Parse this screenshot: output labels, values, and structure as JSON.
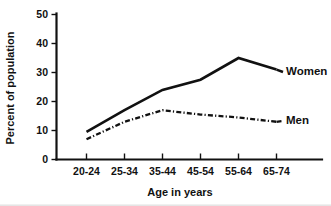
{
  "chart_data": {
    "type": "line",
    "title": "",
    "xlabel": "Age in years",
    "ylabel": "Percent of population",
    "categories": [
      "20-24",
      "25-34",
      "35-44",
      "45-54",
      "55-64",
      "65-74"
    ],
    "ylim": [
      0,
      50
    ],
    "yticks": [
      0,
      10,
      20,
      30,
      40,
      50
    ],
    "ytick_labels": [
      "0",
      "10",
      "20",
      "30",
      "40",
      "50"
    ],
    "grid": false,
    "legend_position": "line-end-labels",
    "series": [
      {
        "name": "Women",
        "style": "solid",
        "color": "#111111",
        "values": [
          9.5,
          17,
          24,
          27.5,
          35,
          31
        ]
      },
      {
        "name": "Men",
        "style": "dash-dot",
        "color": "#111111",
        "values": [
          7,
          13,
          17,
          15.5,
          14.5,
          13
        ]
      }
    ]
  },
  "axes": {
    "y_title": "Percent of population",
    "x_title": "Age in years",
    "y_tick_0": "0",
    "y_tick_1": "10",
    "y_tick_2": "20",
    "y_tick_3": "30",
    "y_tick_4": "40",
    "y_tick_5": "50",
    "x_tick_0": "20-24",
    "x_tick_1": "25-34",
    "x_tick_2": "35-44",
    "x_tick_3": "45-54",
    "x_tick_4": "55-64",
    "x_tick_5": "65-74"
  },
  "series_labels": {
    "women": "Women",
    "men": "Men"
  }
}
